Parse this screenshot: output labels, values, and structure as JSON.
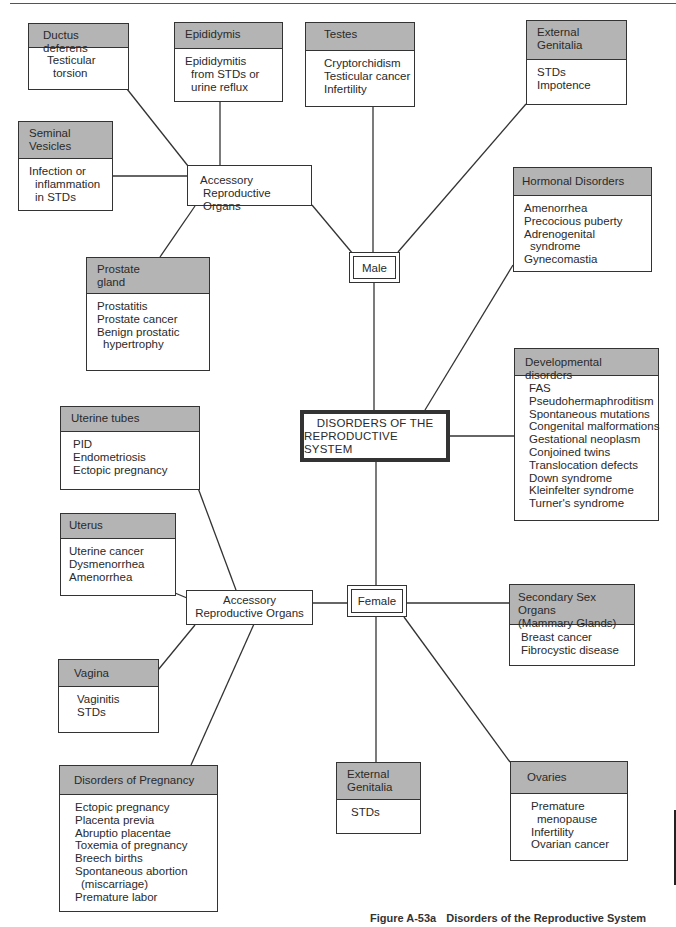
{
  "diagram": {
    "center": {
      "line1": "DISORDERS OF THE",
      "line2": "REPRODUCTIVE SYSTEM"
    },
    "male": {
      "label": "Male",
      "accessory": {
        "line1": "Accessory",
        "line2": "Reproductive Organs"
      },
      "ductus_deferens": {
        "title": "Ductus deferens",
        "items": [
          "Testicular",
          "torsion"
        ]
      },
      "epididymis": {
        "title": "Epididymis",
        "items": [
          "Epididymitis",
          "from STDs or",
          "urine reflux"
        ]
      },
      "seminal_vesicles": {
        "title_line1": "Seminal",
        "title_line2": "Vesicles",
        "items": [
          "Infection or",
          "inflammation",
          "in STDs"
        ]
      },
      "prostate": {
        "title_line1": "Prostate",
        "title_line2": "gland",
        "items": [
          "Prostatitis",
          "Prostate cancer",
          "Benign prostatic",
          "hypertrophy"
        ]
      },
      "testes": {
        "title": "Testes",
        "items": [
          "Cryptorchidism",
          "Testicular cancer",
          "Infertility"
        ]
      },
      "external_genitalia": {
        "title_line1": "External",
        "title_line2": "Genitalia",
        "items": [
          "STDs",
          "Impotence"
        ]
      }
    },
    "hormonal": {
      "title": "Hormonal Disorders",
      "items": [
        "Amenorrhea",
        "Precocious puberty",
        "Adrenogenital",
        "syndrome",
        "Gynecomastia"
      ]
    },
    "developmental": {
      "title": "Developmental disorders",
      "items": [
        "FAS",
        "Pseudohermaphroditism",
        "Spontaneous mutations",
        "Congenital malformations",
        "Gestational neoplasm",
        "Conjoined twins",
        "Translocation defects",
        "Down syndrome",
        "Kleinfelter syndrome",
        "Turner's syndrome"
      ]
    },
    "female": {
      "label": "Female",
      "accessory": {
        "line1": "Accessory",
        "line2": "Reproductive Organs"
      },
      "uterine_tubes": {
        "title": "Uterine tubes",
        "items": [
          "PID",
          "Endometriosis",
          "Ectopic pregnancy"
        ]
      },
      "uterus": {
        "title": "Uterus",
        "items": [
          "Uterine cancer",
          "Dysmenorrhea",
          "Amenorrhea"
        ]
      },
      "vagina": {
        "title": "Vagina",
        "items": [
          "Vaginitis",
          "STDs"
        ]
      },
      "pregnancy": {
        "title": "Disorders of Pregnancy",
        "items": [
          "Ectopic pregnancy",
          "Placenta previa",
          "Abruptio placentae",
          "Toxemia of pregnancy",
          "Breech births",
          "Spontaneous abortion",
          "(miscarriage)",
          "Premature labor"
        ]
      },
      "external_genitalia": {
        "title_line1": "External",
        "title_line2": "Genitalia",
        "items": [
          "STDs"
        ]
      },
      "ovaries": {
        "title": "Ovaries",
        "items": [
          "Premature",
          "menopause",
          "Infertility",
          "Ovarian cancer"
        ]
      },
      "secondary": {
        "title_line1": "Secondary Sex Organs",
        "title_line2": "(Mammary Glands)",
        "items": [
          "Breast cancer",
          "Fibrocystic disease"
        ]
      }
    }
  },
  "caption": {
    "number": "Figure A-53a",
    "title": "Disorders of the Reproductive System"
  }
}
